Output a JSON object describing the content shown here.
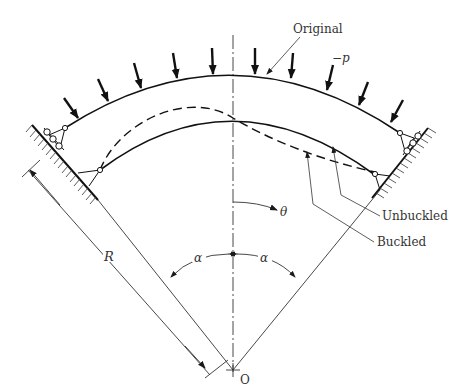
{
  "figure": {
    "type": "structural-diagram",
    "labels": {
      "original": "Original",
      "pressure": "−p",
      "unbuckled": "Unbuckled",
      "buckled": "Buckled",
      "theta": "θ",
      "alpha_left": "α",
      "alpha_right": "α",
      "radius": "R",
      "center": "O"
    },
    "colors": {
      "stroke": "#1a1a1a",
      "text": "#333333",
      "background": "#ffffff"
    },
    "load_arrow_count": 10,
    "caption": "F I G U R E"
  }
}
